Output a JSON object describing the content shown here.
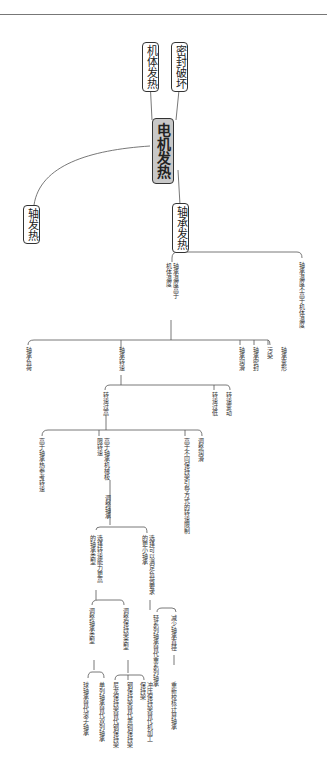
{
  "root": {
    "label": "电机发热"
  },
  "branches": {
    "body": "机体发热",
    "seal": "密封破坏",
    "shaft": "轴发热",
    "bearing": "轴承发热"
  },
  "bearing_tree": {
    "temp_high": "轴承温度高于机体温度",
    "temp_not_high": "轴承温度不高于机体温度",
    "load": "轴承负荷",
    "speed": "轴承转速",
    "lubricant": "轴承润滑",
    "sealing": "轴承密封",
    "dirt": "污染",
    "deform": "轴承变形",
    "speed_high": "转速过高",
    "speed_overhigh": "转速过低",
    "speed_change": "转速变动",
    "above_ref": "高于轴承热参考转速",
    "above_limit": "高于轴承机械极限转速",
    "above_cage": "高于不同保持架引导方式的转速限制",
    "adjust_lube": "调整润滑",
    "adjust_bearing": "调整轴承",
    "choose_higher": "选择转速能力更高的轴承类型",
    "choose_smaller": "选择可以满足负荷要求的更小轴承",
    "adjust_type": "调整轴承类型",
    "adjust_cage": "调整保持架类型",
    "ball_for_roller": "球轴承替代滚子轴承",
    "single_for_double": "单列轴承替代双列轴承",
    "cage_1": "尼龙保持架替代钢保持架",
    "cage_2": "钢保持架替代黄铜保持架",
    "cage_3": "冲压保持架替代机加工保持架",
    "light_series": "轻系列轴承替代重系列轴承",
    "reduce_dia": "减少轴承直径",
    "recheck": "重新校核计算轴承"
  }
}
